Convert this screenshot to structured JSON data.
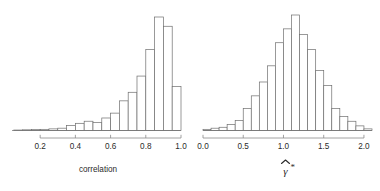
{
  "figure": {
    "background": "#ffffff",
    "bar_stroke": "#6e6e6e",
    "bar_fill": "#ffffff",
    "axis_color": "#8a8a8a",
    "text_color": "#2b2b2b",
    "panel_count": 2
  },
  "chart_data": [
    {
      "type": "bar",
      "subtype": "histogram",
      "panel": "left",
      "title": "",
      "xlabel": "correlation",
      "ylabel": "",
      "grid": false,
      "legend": null,
      "xlim": [
        0.04,
        1.0
      ],
      "ylim": [
        0,
        1
      ],
      "xticks": [
        0.2,
        0.4,
        0.6,
        0.8,
        1.0
      ],
      "xtick_labels": [
        "0.2",
        "0.4",
        "0.6",
        "0.8",
        "1.0"
      ],
      "bin_width": 0.05,
      "bin_edges": [
        0.05,
        0.1,
        0.15,
        0.2,
        0.25,
        0.3,
        0.35,
        0.4,
        0.45,
        0.5,
        0.55,
        0.6,
        0.65,
        0.7,
        0.75,
        0.8,
        0.85,
        0.9,
        0.95,
        1.0
      ],
      "categories": [
        "0.05-0.10",
        "0.10-0.15",
        "0.15-0.20",
        "0.20-0.25",
        "0.25-0.30",
        "0.30-0.35",
        "0.35-0.40",
        "0.40-0.45",
        "0.45-0.50",
        "0.50-0.55",
        "0.55-0.60",
        "0.60-0.65",
        "0.65-0.70",
        "0.70-0.75",
        "0.75-0.80",
        "0.80-0.85",
        "0.85-0.90",
        "0.90-0.95",
        "0.95-1.00"
      ],
      "values": [
        0.004,
        0.006,
        0.008,
        0.01,
        0.014,
        0.02,
        0.042,
        0.062,
        0.08,
        0.07,
        0.108,
        0.15,
        0.256,
        0.33,
        0.47,
        0.7,
        0.98,
        0.9,
        0.38
      ]
    },
    {
      "type": "bar",
      "subtype": "histogram",
      "panel": "right",
      "title": "",
      "xlabel": "gamma-hat-star",
      "xlabel_math": "γ̂*",
      "ylabel": "",
      "grid": false,
      "legend": null,
      "xlim": [
        0.0,
        2.1
      ],
      "ylim": [
        0,
        1
      ],
      "xticks": [
        0.0,
        0.5,
        1.0,
        1.5,
        2.0
      ],
      "xtick_labels": [
        "0.0",
        "0.5",
        "1.0",
        "1.5",
        "2.0"
      ],
      "bin_width": 0.1,
      "bin_edges": [
        0.0,
        0.1,
        0.2,
        0.3,
        0.4,
        0.5,
        0.6,
        0.7,
        0.8,
        0.9,
        1.0,
        1.1,
        1.2,
        1.3,
        1.4,
        1.5,
        1.6,
        1.7,
        1.8,
        1.9,
        2.0,
        2.1
      ],
      "categories": [
        "0.0-0.1",
        "0.1-0.2",
        "0.2-0.3",
        "0.3-0.4",
        "0.4-0.5",
        "0.5-0.6",
        "0.6-0.7",
        "0.7-0.8",
        "0.8-0.9",
        "0.9-1.0",
        "1.0-1.1",
        "1.1-1.2",
        "1.2-1.3",
        "1.3-1.4",
        "1.4-1.5",
        "1.5-1.6",
        "1.6-1.7",
        "1.7-1.8",
        "1.8-1.9",
        "1.9-2.0",
        "2.0-2.1"
      ],
      "values": [
        0.01,
        0.02,
        0.028,
        0.052,
        0.086,
        0.19,
        0.3,
        0.42,
        0.56,
        0.76,
        0.88,
        1.0,
        0.83,
        0.7,
        0.52,
        0.39,
        0.19,
        0.12,
        0.08,
        0.04,
        0.014
      ]
    }
  ],
  "panels": {
    "left": {
      "axis_title": "correlation",
      "tick_labels": [
        "0.2",
        "0.4",
        "0.6",
        "0.8",
        "1.0"
      ]
    },
    "right": {
      "axis_title_base": "γ",
      "axis_title_star": "*",
      "tick_labels": [
        "0.0",
        "0.5",
        "1.0",
        "1.5",
        "2.0"
      ]
    }
  }
}
